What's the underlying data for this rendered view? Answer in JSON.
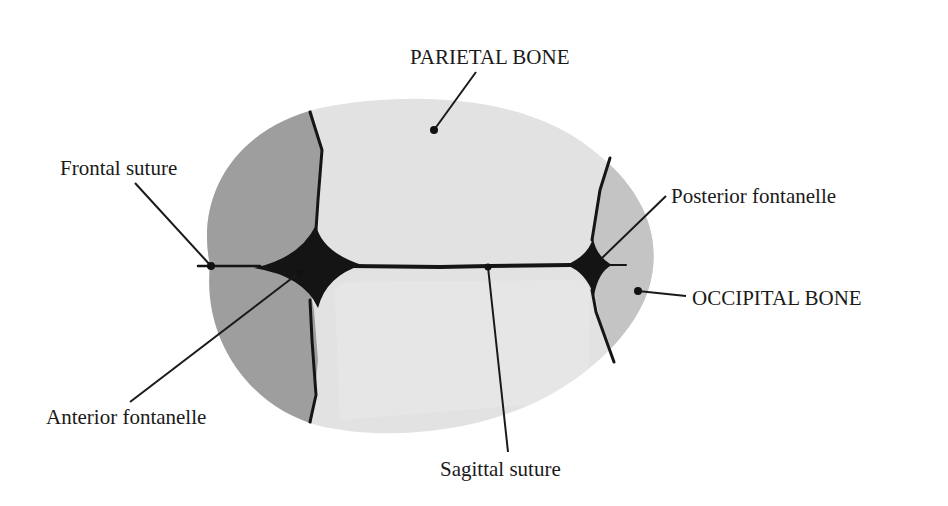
{
  "diagram": {
    "colors": {
      "background": "#ffffff",
      "parietal_bone": "#e2e2e2",
      "parietal_inner": "#e8e8e8",
      "frontal_bone": "#9e9e9e",
      "occipital_bone": "#c4c4c4",
      "suture": "#151515",
      "text": "#1a1a1a"
    },
    "labels": {
      "parietal_bone": "PARIETAL BONE",
      "frontal_suture": "Frontal suture",
      "posterior_fontanelle": "Posterior fontanelle",
      "occipital_bone": "OCCIPITAL BONE",
      "anterior_fontanelle": "Anterior fontanelle",
      "sagittal_suture": "Sagittal suture"
    }
  }
}
